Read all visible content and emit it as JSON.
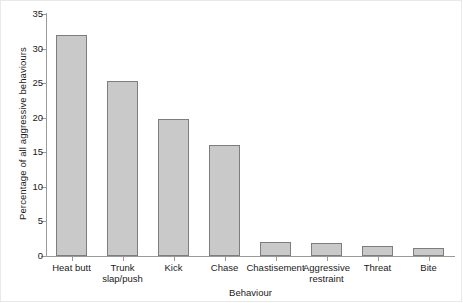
{
  "chart_data": {
    "type": "bar",
    "title": "",
    "xlabel": "Behaviour",
    "ylabel": "Percentage of all aggressive behaviours",
    "categories": [
      "Heat butt",
      "Trunk slap/push",
      "Kick",
      "Chase",
      "Chastisement",
      "Aggressive restraint",
      "Threat",
      "Bite"
    ],
    "values": [
      32.0,
      25.3,
      19.8,
      16.1,
      2.0,
      1.9,
      1.5,
      1.2
    ],
    "ylim": [
      0,
      35
    ],
    "yticks": [
      0,
      5,
      10,
      15,
      20,
      25,
      30,
      35
    ],
    "ytick_labels": [
      "0",
      "5",
      "10",
      "15",
      "20",
      "25",
      "30",
      "35"
    ],
    "grid": false,
    "legend": false,
    "bar_fill_color": "#c9c9c9",
    "bar_edge_color": "#7d7d7d",
    "axis_color": "#9a9a9a",
    "background_color": "#ffffff"
  }
}
